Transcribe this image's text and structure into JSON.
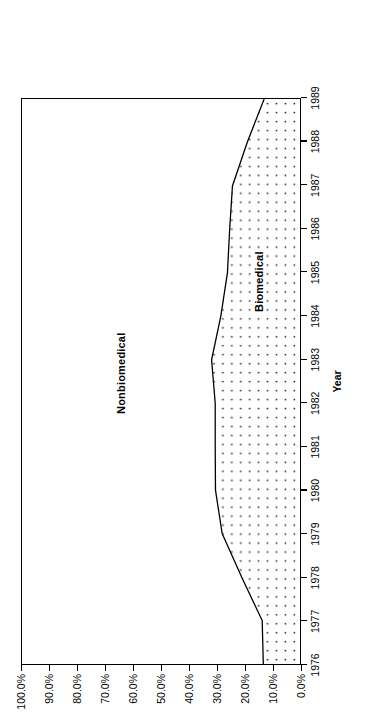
{
  "chart_data": {
    "type": "area",
    "title": "",
    "subtitle": "",
    "xlabel": "Year",
    "ylabel": "% of Disclosures",
    "stacked": true,
    "stack_total": 100,
    "grid": false,
    "legend_position": "inline-band-labels",
    "orientation": "rotated-90-ccw",
    "categories": [
      1976,
      1977,
      1978,
      1979,
      1980,
      1981,
      1982,
      1983,
      1984,
      1985,
      1986,
      1987,
      1988,
      1989
    ],
    "x": [
      "1976",
      "1977",
      "1978",
      "1979",
      "1980",
      "1981",
      "1982",
      "1983",
      "1984",
      "1985",
      "1986",
      "1987",
      "1988",
      "1989"
    ],
    "xlim": [
      1976,
      1989
    ],
    "ylim": [
      0,
      100
    ],
    "ytick_values": [
      0,
      10,
      20,
      30,
      40,
      50,
      60,
      70,
      80,
      90,
      100
    ],
    "ytick_labels": [
      "0.0%",
      "10.0%",
      "20.0%",
      "30.0%",
      "40.0%",
      "50.0%",
      "60.0%",
      "70.0%",
      "80.0%",
      "90.0%",
      "100.0%"
    ],
    "series": [
      {
        "name": "Biomedical",
        "fill": "stipple-dots",
        "color": "#000000",
        "values": [
          13.2,
          13.6,
          21.0,
          28.0,
          30.4,
          30.5,
          30.5,
          31.8,
          28.5,
          26.1,
          25.3,
          24.3,
          19.0,
          12.9
        ]
      },
      {
        "name": "Nonbiomedical",
        "fill": "none",
        "color": "#ffffff",
        "values": [
          86.8,
          86.4,
          79.0,
          72.0,
          69.6,
          69.5,
          69.5,
          68.2,
          71.5,
          73.9,
          74.7,
          75.7,
          81.0,
          87.1
        ]
      }
    ],
    "annotations": [
      {
        "text": "Nonbiomedical",
        "region": "upper-white-band"
      },
      {
        "text": "Biomedical",
        "region": "lower-stippled-band"
      }
    ]
  },
  "labels": {
    "nonbiomedical": "Nonbiomedical",
    "biomedical": "Biomedical",
    "x_title": "Year",
    "y_title": "% of Disclosures"
  }
}
